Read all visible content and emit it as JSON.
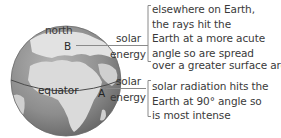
{
  "globe": {
    "north_label": "north",
    "equator_label": "equator",
    "point_b": "B",
    "point_a": "A"
  },
  "rays": [
    {
      "id": "B",
      "line1": "solar",
      "line2": "energy"
    },
    {
      "id": "A",
      "line1": "solar",
      "line2": "energy"
    }
  ],
  "explanations": {
    "elsewhere": [
      "elsewhere on Earth,",
      "the rays hit the",
      "Earth at a more acute",
      "angle so are spread",
      "over a greater surface area."
    ],
    "equator": [
      "solar radiation hits the",
      "Earth at 90° angle so",
      "is most intense"
    ]
  },
  "colors": {
    "line": "#8a8a8a",
    "ocean": "#7a7a7a",
    "land": "#d8d8d8",
    "text": "#3a3a3a"
  }
}
